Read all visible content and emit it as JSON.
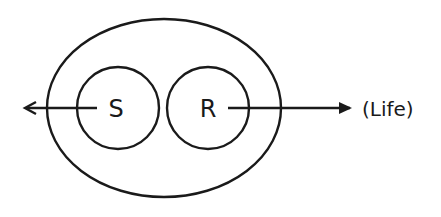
{
  "diagram": {
    "outer_ellipse": {
      "cx": 164,
      "cy": 108,
      "rx": 117,
      "ry": 89
    },
    "circles": [
      {
        "id": "S",
        "label": "S",
        "cx": 118,
        "cy": 108,
        "r": 41
      },
      {
        "id": "R",
        "label": "R",
        "cx": 208,
        "cy": 108,
        "r": 41
      }
    ],
    "arrows": [
      {
        "id": "from-S-left",
        "x1": 97,
        "y1": 108,
        "x2": 25,
        "y2": 108,
        "direction": "left"
      },
      {
        "id": "from-R-right",
        "x1": 228,
        "y1": 108,
        "x2": 352,
        "y2": 108,
        "direction": "right"
      }
    ],
    "annotation": {
      "text": "(Life)",
      "x": 362,
      "y": 116
    },
    "colors": {
      "stroke": "#1a1a1a",
      "background": "#ffffff"
    }
  }
}
